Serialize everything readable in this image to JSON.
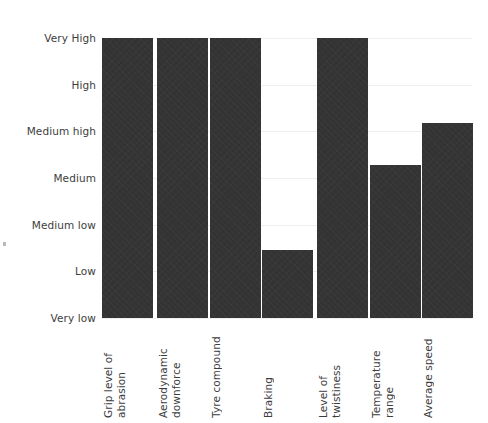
{
  "chart_data": {
    "type": "bar",
    "title": "",
    "subtitle": "",
    "xlabel": "",
    "ylabel": "",
    "orientation": "vertical",
    "grid": true,
    "legend": null,
    "legend_position": "none",
    "bar_color": "#333333",
    "gridline_color": "#eeeeee",
    "text_color": "#3d3d3d",
    "background_color": "#ffffff",
    "y_scale": "ordinal",
    "y_tick_labels": [
      "Very High",
      "High",
      "Medium high",
      "Medium",
      "Medium low",
      "Low",
      "Very low"
    ],
    "y_level_values": {
      "Very High": 7,
      "High": 6,
      "Medium high": 5,
      "Medium": 4,
      "Medium low": 3,
      "Low": 2,
      "Very low": 1
    },
    "ylim": [
      0,
      7
    ],
    "categories": [
      "Grip level of abrasion",
      "Aerodynamic downforce",
      "Tyre compound",
      "Braking",
      "Level of twistiness",
      "Temperature range",
      "Average speed"
    ],
    "value_labels": [
      "Very High",
      "Very High",
      "Very High",
      "Low",
      "Very High",
      "Medium",
      "Medium high"
    ],
    "values": [
      7,
      7,
      7,
      2,
      7,
      4,
      5
    ]
  },
  "axes": {
    "y_ticks": [
      {
        "label": "Very High",
        "value": 7,
        "y_px": 0
      },
      {
        "label": "High",
        "value": 6,
        "y_px": 46.7
      },
      {
        "label": "Medium high",
        "value": 5,
        "y_px": 93.3
      },
      {
        "label": "Medium",
        "value": 4,
        "y_px": 140
      },
      {
        "label": "Medium low",
        "value": 3,
        "y_px": 186.7
      },
      {
        "label": "Low",
        "value": 2,
        "y_px": 233.3
      },
      {
        "label": "Very low",
        "value": 1,
        "y_px": 280
      }
    ],
    "bars": [
      {
        "label": "Grip level of abrasion",
        "level": "Very High",
        "value": 7,
        "x_px": 0,
        "w_px": 51,
        "h_px": 280
      },
      {
        "label": "Aerodynamic downforce",
        "level": "Very High",
        "value": 7,
        "x_px": 55,
        "w_px": 51,
        "h_px": 280
      },
      {
        "label": "Tyre compound",
        "level": "Very High",
        "value": 7,
        "x_px": 108,
        "w_px": 51,
        "h_px": 280
      },
      {
        "label": "Braking",
        "level": "Low",
        "value": 2,
        "x_px": 160,
        "w_px": 51,
        "h_px": 68
      },
      {
        "label": "Level of twistiness",
        "level": "Very High",
        "value": 7,
        "x_px": 215,
        "w_px": 51,
        "h_px": 280
      },
      {
        "label": "Temperature range",
        "level": "Medium",
        "value": 4,
        "x_px": 268,
        "w_px": 51,
        "h_px": 153
      },
      {
        "label": "Average speed",
        "level": "Medium high",
        "value": 5,
        "x_px": 320,
        "w_px": 51,
        "h_px": 195
      }
    ]
  }
}
